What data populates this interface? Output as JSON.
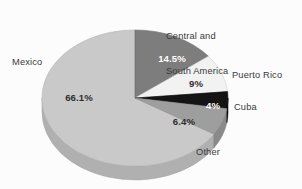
{
  "chart_data": {
    "type": "pie",
    "title": "",
    "subtitle": "",
    "xlabel": "",
    "ylabel": "",
    "legend_position": "none",
    "grid": false,
    "three_d": true,
    "categories": [
      "Mexico",
      "Central and South America",
      "Puerto Rico",
      "Cuba",
      "Other"
    ],
    "values": [
      66.1,
      14.5,
      9.0,
      4.0,
      6.4
    ],
    "value_labels": [
      "66.1%",
      "14.5%",
      "9%",
      "4%",
      "6.4%"
    ],
    "colors": [
      "#c9c9c9",
      "#7d7d7d",
      "#f2f2f2",
      "#141414",
      "#9e9e9e"
    ],
    "slices": [
      {
        "name": "Mexico",
        "value": 66.1,
        "value_label": "66.1%",
        "color": "#c9c9c9",
        "side_color": "#b0b0b0",
        "label_color": "#2e2e2e"
      },
      {
        "name": "Central and South America",
        "name_line1": "Central and",
        "name_line2": "South America",
        "value": 14.5,
        "value_label": "14.5%",
        "color": "#7d7d7d",
        "side_color": "#6a6a6a",
        "label_color": "#ffffff"
      },
      {
        "name": "Puerto Rico",
        "value": 9.0,
        "value_label": "9%",
        "color": "#f2f2f2",
        "side_color": "#d9d9d9",
        "label_color": "#2e2e2e"
      },
      {
        "name": "Cuba",
        "value": 4.0,
        "value_label": "4%",
        "color": "#141414",
        "side_color": "#0d0d0d",
        "label_color": "#ffffff"
      },
      {
        "name": "Other",
        "value": 6.4,
        "value_label": "6.4%",
        "color": "#9e9e9e",
        "side_color": "#8a8a8a",
        "label_color": "#2e2e2e"
      }
    ]
  },
  "labels": {
    "mexico": "Mexico",
    "central_south_america_line1": "Central and",
    "central_south_america_line2": "South America",
    "puerto_rico": "Puerto Rico",
    "cuba": "Cuba",
    "other": "Other"
  },
  "value_labels": {
    "mexico": "66.1%",
    "central_south_america": "14.5%",
    "puerto_rico": "9%",
    "cuba": "4%",
    "other": "6.4%"
  },
  "style": {
    "background": "#fcfcfc",
    "text_color": "#3a3a3a"
  }
}
